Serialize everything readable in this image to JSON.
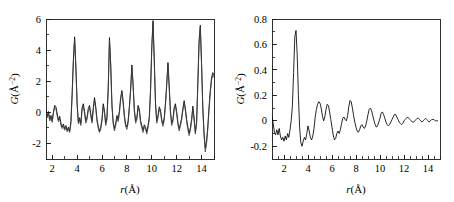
{
  "figure": {
    "panel_count": 2,
    "background_color": "#ffffff",
    "line_color": "#000000",
    "secondary_line_color": "#3d3d3d"
  },
  "chart_data": [
    {
      "type": "line",
      "panel": "left",
      "title": "",
      "xlabel": "r(Å)",
      "ylabel": "G(Å⁻²)",
      "xlim": [
        1.5,
        15.0
      ],
      "ylim": [
        -3.0,
        6.0
      ],
      "xticks": [
        2,
        4,
        6,
        8,
        10,
        12,
        14
      ],
      "xtick_labels": [
        "2",
        "4",
        "6",
        "8",
        "10",
        "12",
        "14"
      ],
      "yticks": [
        -2,
        0,
        2,
        4,
        6
      ],
      "ytick_labels": [
        "-2",
        "0",
        "2",
        "4",
        "6"
      ],
      "minor_x_step": 1,
      "minor_y_step": 1,
      "grid": false,
      "legend": "none",
      "series": [
        {
          "name": "experimental-pdf",
          "color": "#000000",
          "x": [
            1.5,
            1.6,
            1.7,
            1.8,
            1.9,
            2.0,
            2.1,
            2.2,
            2.3,
            2.4,
            2.5,
            2.6,
            2.7,
            2.8,
            2.9,
            3.0,
            3.1,
            3.2,
            3.3,
            3.4,
            3.5,
            3.6,
            3.7,
            3.8,
            3.9,
            4.0,
            4.1,
            4.2,
            4.3,
            4.4,
            4.5,
            4.6,
            4.7,
            4.8,
            4.9,
            5.0,
            5.1,
            5.2,
            5.3,
            5.4,
            5.5,
            5.6,
            5.7,
            5.8,
            5.9,
            6.0,
            6.1,
            6.2,
            6.3,
            6.4,
            6.5,
            6.6,
            6.7,
            6.8,
            6.9,
            7.0,
            7.1,
            7.2,
            7.3,
            7.4,
            7.5,
            7.6,
            7.7,
            7.8,
            7.9,
            8.0,
            8.1,
            8.2,
            8.3,
            8.4,
            8.5,
            8.6,
            8.7,
            8.8,
            8.9,
            9.0,
            9.1,
            9.2,
            9.3,
            9.4,
            9.5,
            9.6,
            9.7,
            9.8,
            9.9,
            10.0,
            10.1,
            10.2,
            10.3,
            10.4,
            10.5,
            10.6,
            10.7,
            10.8,
            10.9,
            11.0,
            11.1,
            11.2,
            11.3,
            11.4,
            11.5,
            11.6,
            11.7,
            11.8,
            11.9,
            12.0,
            12.1,
            12.2,
            12.3,
            12.4,
            12.5,
            12.6,
            12.7,
            12.8,
            12.9,
            13.0,
            13.1,
            13.2,
            13.3,
            13.4,
            13.5,
            13.6,
            13.7,
            13.8,
            13.9,
            14.0,
            14.1,
            14.2,
            14.3,
            14.4,
            14.5,
            14.6,
            14.7,
            14.8,
            14.9,
            15.0
          ],
          "y": [
            0.1,
            -0.25,
            0.05,
            -0.45,
            -0.2,
            -0.55,
            0.05,
            0.45,
            0.35,
            -0.1,
            -0.5,
            -0.25,
            -0.7,
            -0.95,
            -0.75,
            -1.05,
            -0.85,
            -1.15,
            -0.95,
            -1.2,
            -0.6,
            1.2,
            3.4,
            4.85,
            3.0,
            0.6,
            -0.6,
            -0.35,
            -0.7,
            0.3,
            0.55,
            0.05,
            -0.55,
            -0.3,
            0.25,
            0.45,
            -0.1,
            -0.55,
            0.3,
            0.95,
            0.35,
            -0.45,
            -0.9,
            -1.2,
            -0.95,
            -0.4,
            0.55,
            0.1,
            -0.7,
            -0.3,
            1.6,
            4.8,
            3.1,
            0.5,
            -0.6,
            -1.05,
            -0.7,
            -0.2,
            -0.45,
            0.1,
            0.95,
            1.4,
            0.7,
            -0.2,
            -0.75,
            -0.95,
            -0.55,
            0.4,
            1.5,
            3.05,
            1.8,
            0.2,
            -0.55,
            -0.35,
            0.45,
            0.2,
            -0.55,
            -0.85,
            -1.15,
            -0.8,
            -0.95,
            -1.25,
            -0.85,
            -0.3,
            1.4,
            4.2,
            5.9,
            3.4,
            0.6,
            -0.55,
            -0.2,
            0.35,
            0.15,
            -0.45,
            -0.75,
            -0.35,
            0.6,
            1.85,
            3.2,
            1.7,
            0.1,
            -0.7,
            -0.45,
            0.3,
            0.55,
            0.05,
            -0.65,
            -1.05,
            -0.75,
            -0.35,
            0.25,
            0.75,
            0.25,
            -0.45,
            -0.95,
            -1.35,
            -1.0,
            -0.45,
            0.4,
            -0.35,
            -1.25,
            -0.6,
            1.9,
            4.6,
            5.6,
            3.2,
            0.35,
            -1.3,
            -2.3,
            -1.85,
            -0.95,
            0.3,
            1.4,
            2.2,
            2.55,
            2.4
          ]
        },
        {
          "name": "calculated-fit",
          "color": "#3d3d3d",
          "x": [
            1.5,
            1.6,
            1.7,
            1.8,
            1.9,
            2.0,
            2.1,
            2.2,
            2.3,
            2.4,
            2.5,
            2.6,
            2.7,
            2.8,
            2.9,
            3.0,
            3.1,
            3.2,
            3.3,
            3.4,
            3.5,
            3.6,
            3.7,
            3.8,
            3.9,
            4.0,
            4.1,
            4.2,
            4.3,
            4.4,
            4.5,
            4.6,
            4.7,
            4.8,
            4.9,
            5.0,
            5.1,
            5.2,
            5.3,
            5.4,
            5.5,
            5.6,
            5.7,
            5.8,
            5.9,
            6.0,
            6.1,
            6.2,
            6.3,
            6.4,
            6.5,
            6.6,
            6.7,
            6.8,
            6.9,
            7.0,
            7.1,
            7.2,
            7.3,
            7.4,
            7.5,
            7.6,
            7.7,
            7.8,
            7.9,
            8.0,
            8.1,
            8.2,
            8.3,
            8.4,
            8.5,
            8.6,
            8.7,
            8.8,
            8.9,
            9.0,
            9.1,
            9.2,
            9.3,
            9.4,
            9.5,
            9.6,
            9.7,
            9.8,
            9.9,
            10.0,
            10.1,
            10.2,
            10.3,
            10.4,
            10.5,
            10.6,
            10.7,
            10.8,
            10.9,
            11.0,
            11.1,
            11.2,
            11.3,
            11.4,
            11.5,
            11.6,
            11.7,
            11.8,
            11.9,
            12.0,
            12.1,
            12.2,
            12.3,
            12.4,
            12.5,
            12.6,
            12.7,
            12.8,
            12.9,
            13.0,
            13.1,
            13.2,
            13.3,
            13.4,
            13.5,
            13.6,
            13.7,
            13.8,
            13.9,
            14.0,
            14.1,
            14.2,
            14.3,
            14.4,
            14.5,
            14.6,
            14.7,
            14.8,
            14.9,
            15.0
          ],
          "y": [
            -0.05,
            -0.35,
            -0.1,
            -0.55,
            -0.35,
            -0.65,
            -0.05,
            0.3,
            0.25,
            -0.25,
            -0.6,
            -0.4,
            -0.85,
            -1.05,
            -0.9,
            -1.15,
            -1.0,
            -1.25,
            -1.1,
            -1.3,
            -0.75,
            1.0,
            3.2,
            4.7,
            2.85,
            0.45,
            -0.75,
            -0.5,
            -0.85,
            0.15,
            0.4,
            -0.1,
            -0.7,
            -0.45,
            0.1,
            0.3,
            -0.25,
            -0.7,
            0.15,
            0.8,
            0.2,
            -0.6,
            -1.05,
            -1.3,
            -1.1,
            -0.55,
            0.4,
            -0.05,
            -0.85,
            -0.45,
            1.45,
            4.65,
            2.95,
            0.35,
            -0.75,
            -1.2,
            -0.85,
            -0.35,
            -0.6,
            -0.05,
            0.8,
            1.25,
            0.55,
            -0.35,
            -0.9,
            -1.1,
            -0.7,
            0.25,
            1.35,
            2.9,
            1.65,
            0.05,
            -0.7,
            -0.5,
            0.3,
            0.05,
            -0.7,
            -1.0,
            -1.3,
            -0.95,
            -1.1,
            -1.4,
            -1.0,
            -0.45,
            1.25,
            4.05,
            5.75,
            3.25,
            0.45,
            -0.7,
            -0.35,
            0.2,
            0.0,
            -0.6,
            -0.9,
            -0.5,
            0.45,
            1.7,
            3.05,
            1.55,
            -0.05,
            -0.85,
            -0.6,
            0.15,
            0.4,
            -0.1,
            -0.8,
            -1.2,
            -0.9,
            -0.5,
            0.1,
            0.6,
            0.1,
            -0.6,
            -1.1,
            -1.5,
            -1.15,
            -0.6,
            0.25,
            -0.5,
            -1.4,
            -0.8,
            1.7,
            4.4,
            5.45,
            3.05,
            0.2,
            -1.5,
            -2.55,
            -2.05,
            -1.1,
            0.15,
            1.25,
            2.05,
            2.4,
            2.25
          ]
        }
      ]
    },
    {
      "type": "line",
      "panel": "right",
      "title": "",
      "xlabel": "r(Å)",
      "ylabel": "G(Å⁻²)",
      "xlim": [
        1.0,
        15.0
      ],
      "ylim": [
        -0.3,
        0.8
      ],
      "xticks": [
        2,
        4,
        6,
        8,
        10,
        12,
        14
      ],
      "xtick_labels": [
        "2",
        "4",
        "6",
        "8",
        "10",
        "12",
        "14"
      ],
      "yticks": [
        -0.2,
        0.0,
        0.2,
        0.4,
        0.6,
        0.8
      ],
      "ytick_labels": [
        "-0.2",
        "0",
        "0.2",
        "0.4",
        "0.6",
        "0.8"
      ],
      "minor_x_step": 0.5,
      "minor_y_step": 0.1,
      "grid": false,
      "legend": "none",
      "series": [
        {
          "name": "difference-pdf",
          "color": "#000000",
          "x": [
            1.0,
            1.1,
            1.2,
            1.3,
            1.4,
            1.5,
            1.6,
            1.7,
            1.8,
            1.9,
            2.0,
            2.1,
            2.2,
            2.3,
            2.4,
            2.5,
            2.6,
            2.7,
            2.8,
            2.9,
            3.0,
            3.1,
            3.2,
            3.3,
            3.4,
            3.5,
            3.6,
            3.7,
            3.8,
            3.9,
            4.0,
            4.1,
            4.2,
            4.3,
            4.4,
            4.5,
            4.6,
            4.7,
            4.8,
            4.9,
            5.0,
            5.1,
            5.2,
            5.3,
            5.4,
            5.5,
            5.6,
            5.7,
            5.8,
            5.9,
            6.0,
            6.1,
            6.2,
            6.3,
            6.4,
            6.5,
            6.6,
            6.7,
            6.8,
            6.9,
            7.0,
            7.1,
            7.2,
            7.3,
            7.4,
            7.5,
            7.6,
            7.7,
            7.8,
            7.9,
            8.0,
            8.1,
            8.2,
            8.3,
            8.4,
            8.5,
            8.6,
            8.7,
            8.8,
            8.9,
            9.0,
            9.1,
            9.2,
            9.3,
            9.4,
            9.5,
            9.6,
            9.7,
            9.8,
            9.9,
            10.0,
            10.1,
            10.2,
            10.3,
            10.4,
            10.5,
            10.6,
            10.7,
            10.8,
            10.9,
            11.0,
            11.1,
            11.2,
            11.3,
            11.4,
            11.5,
            11.6,
            11.7,
            11.8,
            11.9,
            12.0,
            12.1,
            12.2,
            12.3,
            12.4,
            12.5,
            12.6,
            12.7,
            12.8,
            12.9,
            13.0,
            13.1,
            13.2,
            13.3,
            13.4,
            13.5,
            13.6,
            13.7,
            13.8,
            13.9,
            14.0,
            14.1,
            14.2,
            14.3,
            14.4,
            14.5,
            14.6,
            14.7,
            14.8,
            14.9,
            15.0
          ],
          "y": [
            0.03,
            -0.02,
            -0.09,
            -0.11,
            -0.07,
            -0.11,
            -0.06,
            -0.12,
            -0.15,
            -0.13,
            -0.16,
            -0.12,
            -0.15,
            -0.1,
            -0.13,
            -0.07,
            0.0,
            0.12,
            0.38,
            0.66,
            0.71,
            0.52,
            0.2,
            -0.05,
            -0.17,
            -0.2,
            -0.16,
            -0.13,
            -0.15,
            -0.1,
            -0.04,
            -0.08,
            -0.13,
            -0.15,
            -0.12,
            -0.06,
            0.03,
            0.09,
            0.13,
            0.15,
            0.14,
            0.1,
            0.04,
            0.0,
            0.03,
            0.09,
            0.13,
            0.12,
            0.07,
            0.01,
            -0.05,
            -0.11,
            -0.15,
            -0.14,
            -0.1,
            -0.08,
            -0.1,
            -0.07,
            -0.02,
            0.02,
            0.03,
            0.01,
            0.0,
            0.04,
            0.11,
            0.16,
            0.15,
            0.1,
            0.04,
            -0.01,
            -0.05,
            -0.08,
            -0.09,
            -0.07,
            -0.04,
            -0.03,
            -0.05,
            -0.06,
            -0.04,
            0.0,
            0.05,
            0.09,
            0.1,
            0.08,
            0.04,
            0.0,
            -0.03,
            -0.05,
            -0.04,
            -0.01,
            0.02,
            0.06,
            0.07,
            0.05,
            0.02,
            -0.01,
            -0.03,
            -0.04,
            -0.03,
            -0.01,
            0.01,
            0.03,
            0.05,
            0.05,
            0.03,
            0.01,
            -0.01,
            -0.02,
            -0.03,
            -0.02,
            0.0,
            0.01,
            0.02,
            0.03,
            0.02,
            0.01,
            0.0,
            -0.01,
            -0.01,
            0.0,
            0.01,
            0.02,
            0.02,
            0.01,
            0.0,
            -0.01,
            0.0,
            0.01,
            0.02,
            0.01,
            0.0,
            -0.01,
            0.0,
            0.01,
            0.01,
            0.01,
            0.0,
            0.0,
            0.0
          ]
        }
      ]
    }
  ]
}
